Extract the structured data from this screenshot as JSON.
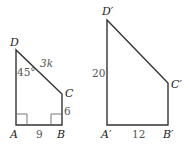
{
  "figures": [
    {
      "name": "ABCD",
      "vertices": {
        "D": {
          "label": "D",
          "x": 16,
          "y": 50
        },
        "A": {
          "label": "A",
          "x": 16,
          "y": 125
        },
        "B": {
          "label": "B",
          "x": 62,
          "y": 125
        },
        "C": {
          "label": "C",
          "x": 62,
          "y": 94
        }
      },
      "measures": {
        "angle_D": "45°",
        "DC": "3k",
        "CB": "6",
        "AB": "9"
      },
      "right_angles": [
        "A",
        "B"
      ]
    },
    {
      "name": "A'B'C'D'",
      "vertices": {
        "D": {
          "label": "D′",
          "x": 107,
          "y": 20
        },
        "A": {
          "label": "A′",
          "x": 107,
          "y": 125
        },
        "B": {
          "label": "B′",
          "x": 168,
          "y": 125
        },
        "C": {
          "label": "C′",
          "x": 168,
          "y": 83
        }
      },
      "measures": {
        "DA": "20",
        "AB": "12"
      }
    }
  ]
}
